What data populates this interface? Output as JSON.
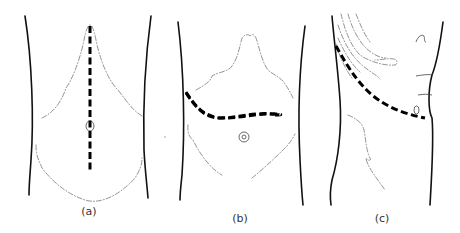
{
  "figure": {
    "panels": [
      {
        "id": "a",
        "label": "(a)",
        "incision": "vertical midline incision"
      },
      {
        "id": "b",
        "label": "(b)",
        "incision": "transverse upper abdominal incision"
      },
      {
        "id": "c",
        "label": "(c)",
        "incision": "oblique flank incision"
      }
    ]
  },
  "colors": {
    "outline": "#111111",
    "incision": "#000000",
    "faint_contour": "#777777",
    "background": "#ffffff"
  }
}
